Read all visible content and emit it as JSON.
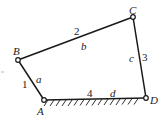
{
  "diagram": {
    "type": "four-bar linkage",
    "joints": {
      "A": {
        "label": "A",
        "x": 44,
        "y": 100
      },
      "B": {
        "label": "B",
        "x": 18,
        "y": 60
      },
      "C": {
        "label": "C",
        "x": 133,
        "y": 17
      },
      "D": {
        "label": "D",
        "x": 146,
        "y": 98
      }
    },
    "links": [
      {
        "id": "1",
        "number": "1",
        "length_symbol": "a",
        "from": "A",
        "to": "B"
      },
      {
        "id": "2",
        "number": "2",
        "length_symbol": "b",
        "from": "B",
        "to": "C"
      },
      {
        "id": "3",
        "number": "3",
        "length_symbol": "c",
        "from": "C",
        "to": "D"
      },
      {
        "id": "4",
        "number": "4",
        "length_symbol": "d",
        "from": "A",
        "to": "D",
        "ground": true
      }
    ],
    "colors": {
      "line": "#1a1a1a",
      "background": "#ffffff"
    }
  }
}
